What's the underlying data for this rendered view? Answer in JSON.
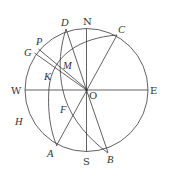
{
  "diagram": {
    "center": {
      "name": "O",
      "x": 86.5,
      "y": 90
    },
    "radius": 61.5,
    "compass_labels": {
      "north": "N",
      "south": "S",
      "west": "W",
      "east": "E"
    },
    "point_labels": {
      "A": "A",
      "B": "B",
      "C": "C",
      "D": "D",
      "F": "F",
      "G": "G",
      "H": "H",
      "K": "K",
      "M": "M",
      "O": "O",
      "P": "P"
    },
    "points": {
      "D": [
        66,
        29
      ],
      "C": [
        117,
        35
      ],
      "A": [
        57,
        146
      ],
      "B": [
        108,
        153
      ],
      "M": [
        60,
        65
      ],
      "K": [
        58,
        67
      ],
      "F": [
        73,
        115
      ]
    },
    "stroke_color": "#3a3a3a",
    "text_color": "#333333"
  }
}
